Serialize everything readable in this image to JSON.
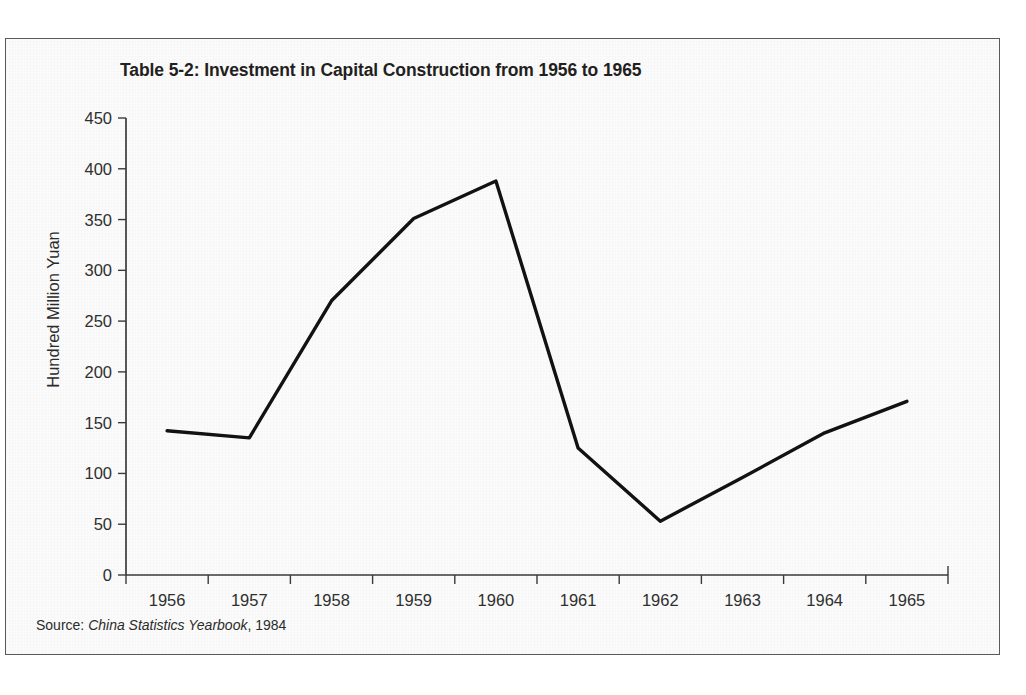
{
  "figure": {
    "title": "Table 5-2: Investment in Capital Construction from 1956 to 1965",
    "source_prefix": "Source:",
    "source_publication": "China Statistics Yearbook",
    "source_year": ", 1984"
  },
  "chart_data": {
    "type": "line",
    "title": "Table 5-2: Investment in Capital Construction from 1956 to 1965",
    "xlabel": "",
    "ylabel": "Hundred Million Yuan",
    "categories": [
      "1956",
      "1957",
      "1958",
      "1959",
      "1960",
      "1961",
      "1962",
      "1963",
      "1964",
      "1965"
    ],
    "series": [
      {
        "name": "Investment in Capital Construction",
        "values": [
          142,
          135,
          270,
          351,
          388,
          125,
          53,
          96,
          140,
          171
        ]
      }
    ],
    "ylim": [
      0,
      450
    ],
    "yticks": [
      0,
      50,
      100,
      150,
      200,
      250,
      300,
      350,
      400,
      450
    ],
    "ytick_labels": [
      "0",
      "50",
      "100",
      "150",
      "200",
      "250",
      "300",
      "350",
      "400",
      "450"
    ],
    "xtick_labels": [
      "1956",
      "1957",
      "1958",
      "1959",
      "1960",
      "1961",
      "1962",
      "1963",
      "1964",
      "1965"
    ],
    "grid": false,
    "legend": "none",
    "line_color": "#121212",
    "units": "Hundred Million Yuan"
  }
}
